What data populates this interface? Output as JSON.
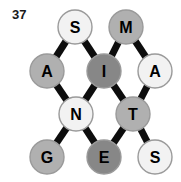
{
  "figure": {
    "index_label": "37",
    "width": 181,
    "height": 182,
    "background": "#ffffff"
  },
  "palette": {
    "edge": "#0d0d0d",
    "node_border": "#9a9a9a",
    "node_text": "#000000",
    "fill_light": "#f2f2f2",
    "fill_medium": "#b0b0b0",
    "fill_dark": "#878787"
  },
  "graph": {
    "type": "undirected-lattice-graph",
    "node_radius": 17,
    "nodes": [
      {
        "id": "n0",
        "label": "S",
        "x": 75,
        "y": 27,
        "shade": "light",
        "fill": "#f2f2f2"
      },
      {
        "id": "n1",
        "label": "M",
        "x": 126,
        "y": 27,
        "shade": "medium",
        "fill": "#b0b0b0"
      },
      {
        "id": "n2",
        "label": "A",
        "x": 47,
        "y": 71,
        "shade": "medium",
        "fill": "#b0b0b0"
      },
      {
        "id": "n3",
        "label": "I",
        "x": 104,
        "y": 71,
        "shade": "dark",
        "fill": "#878787"
      },
      {
        "id": "n4",
        "label": "A",
        "x": 155,
        "y": 71,
        "shade": "light",
        "fill": "#f2f2f2"
      },
      {
        "id": "n5",
        "label": "N",
        "x": 76,
        "y": 114,
        "shade": "light",
        "fill": "#f2f2f2"
      },
      {
        "id": "n6",
        "label": "T",
        "x": 133,
        "y": 114,
        "shade": "medium",
        "fill": "#b0b0b0"
      },
      {
        "id": "n7",
        "label": "G",
        "x": 47,
        "y": 157,
        "shade": "medium",
        "fill": "#b0b0b0"
      },
      {
        "id": "n8",
        "label": "E",
        "x": 104,
        "y": 157,
        "shade": "dark",
        "fill": "#878787"
      },
      {
        "id": "n9",
        "label": "S",
        "x": 155,
        "y": 157,
        "shade": "light",
        "fill": "#f2f2f2"
      }
    ],
    "edges": [
      {
        "from": "n0",
        "to": "n2"
      },
      {
        "from": "n0",
        "to": "n3"
      },
      {
        "from": "n1",
        "to": "n3"
      },
      {
        "from": "n1",
        "to": "n4"
      },
      {
        "from": "n2",
        "to": "n5"
      },
      {
        "from": "n3",
        "to": "n5"
      },
      {
        "from": "n3",
        "to": "n6"
      },
      {
        "from": "n4",
        "to": "n6"
      },
      {
        "from": "n5",
        "to": "n7"
      },
      {
        "from": "n5",
        "to": "n8"
      },
      {
        "from": "n6",
        "to": "n8"
      },
      {
        "from": "n6",
        "to": "n9"
      }
    ]
  }
}
